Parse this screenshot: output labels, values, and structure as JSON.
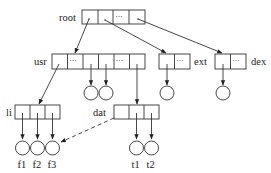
{
  "diagram": {
    "title": "",
    "type": "directory tree",
    "colors": {
      "stroke": "#333333",
      "text": "#222222",
      "background": "#ffffff"
    },
    "nodes": {
      "root": {
        "label": "root",
        "cells": [
          "",
          "",
          "···",
          ""
        ]
      },
      "usr": {
        "label": "usr",
        "cells": [
          "",
          "···",
          "",
          "",
          "···",
          ""
        ]
      },
      "ext": {
        "label": "ext",
        "cells": [
          "",
          "···"
        ]
      },
      "dex": {
        "label": "dex",
        "cells": [
          "",
          "···"
        ]
      },
      "li": {
        "label": "li",
        "cells": [
          "",
          "",
          ""
        ]
      },
      "dat": {
        "label": "dat",
        "cells": [
          "",
          "",
          ""
        ]
      }
    },
    "leaves": {
      "f1": {
        "label": "f1"
      },
      "f2": {
        "label": "f2"
      },
      "f3": {
        "label": "f3"
      },
      "t1": {
        "label": "t1"
      },
      "t2": {
        "label": "t2"
      }
    },
    "edges": [
      {
        "from": "root.cell1",
        "to": "usr",
        "style": "solid"
      },
      {
        "from": "root.cell2",
        "to": "ext",
        "style": "solid"
      },
      {
        "from": "root.cell4",
        "to": "dex",
        "style": "solid"
      },
      {
        "from": "usr.cell1",
        "to": "li",
        "style": "solid"
      },
      {
        "from": "usr.cell3",
        "to": "usr-leaf-1",
        "style": "solid"
      },
      {
        "from": "usr.cell4",
        "to": "usr-leaf-2",
        "style": "solid"
      },
      {
        "from": "usr.cell6",
        "to": "dat",
        "style": "solid"
      },
      {
        "from": "ext.cell1",
        "to": "ext-leaf",
        "style": "solid"
      },
      {
        "from": "dex.cell1",
        "to": "dex-leaf",
        "style": "solid"
      },
      {
        "from": "li.cell1",
        "to": "f1",
        "style": "solid"
      },
      {
        "from": "li.cell2",
        "to": "f2",
        "style": "solid"
      },
      {
        "from": "li.cell3",
        "to": "f3",
        "style": "solid"
      },
      {
        "from": "dat.cell1",
        "to": "f3",
        "style": "dashed"
      },
      {
        "from": "dat.cell2",
        "to": "t1",
        "style": "solid"
      },
      {
        "from": "dat.cell3",
        "to": "t2",
        "style": "solid"
      }
    ]
  }
}
